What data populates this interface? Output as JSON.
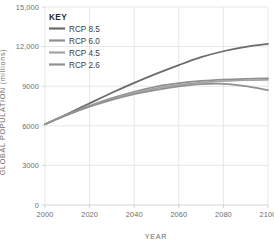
{
  "chart_data": {
    "type": "line",
    "title": "",
    "xlabel": "YEAR",
    "ylabel": "GLOBAL POPULATION (millions)",
    "xlim": [
      2000,
      2100
    ],
    "ylim": [
      0,
      15000
    ],
    "grid": true,
    "legend_position": "top-left-inside",
    "legend_title": "KEY",
    "x": [
      2000,
      2010,
      2020,
      2030,
      2040,
      2050,
      2060,
      2070,
      2080,
      2090,
      2100
    ],
    "xticks": [
      "2000",
      "2020",
      "2040",
      "2060",
      "2080",
      "2100"
    ],
    "yticks": [
      "0",
      "3000",
      "6000",
      "9000",
      "12,000",
      "15,000"
    ],
    "series": [
      {
        "name": "RCP 8.5",
        "color": "#6b6b6b",
        "values": [
          6120,
          6900,
          7700,
          8500,
          9250,
          9950,
          10600,
          11200,
          11650,
          11980,
          12200
        ]
      },
      {
        "name": "RCP 6.0",
        "color": "#8f8f8f",
        "values": [
          6120,
          6850,
          7520,
          8100,
          8580,
          8980,
          9230,
          9400,
          9500,
          9560,
          9600
        ]
      },
      {
        "name": "RCP 4.5",
        "color": "#a3a3a3",
        "values": [
          6120,
          6840,
          7480,
          8030,
          8480,
          8850,
          9100,
          9280,
          9390,
          9450,
          9480
        ]
      },
      {
        "name": "RCP 2.6",
        "color": "#909090",
        "values": [
          6120,
          6820,
          7440,
          7960,
          8390,
          8720,
          8980,
          9150,
          9180,
          9010,
          8700
        ]
      }
    ]
  },
  "legend": {
    "title": "KEY",
    "items": [
      {
        "label": "RCP 8.5",
        "color": "#6b6b6b"
      },
      {
        "label": "RCP 6.0",
        "color": "#8f8f8f"
      },
      {
        "label": "RCP 4.5",
        "color": "#a3a3a3"
      },
      {
        "label": "RCP 2.6",
        "color": "#909090"
      }
    ]
  },
  "axes": {
    "x_title": "YEAR",
    "y_title": "GLOBAL POPULATION (millions)",
    "x_ticks": [
      "2000",
      "2020",
      "2040",
      "2060",
      "2080",
      "2100"
    ],
    "y_ticks": [
      "15,000",
      "12,000",
      "9000",
      "6000",
      "3000",
      "0"
    ]
  },
  "colors": {
    "grid": "#dcdcdc",
    "axis": "#c8c8c8",
    "tick_text": "#6e6e6e",
    "legend_text": "#3d3d3d",
    "background": "#ffffff"
  }
}
